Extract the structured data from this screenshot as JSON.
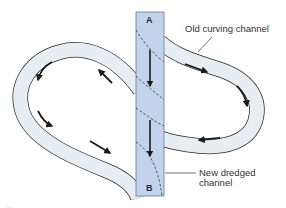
{
  "diagram": {
    "type": "river-meander-cutoff",
    "labels": {
      "old_channel": "Old curving channel",
      "new_channel_line1": "New dredged",
      "new_channel_line2": "channel",
      "point_a": "A",
      "point_b": "B"
    },
    "caption_fragment": "...",
    "colors": {
      "water": "#e6eef4",
      "new_channel": "#c3d3ec",
      "outline": "#2b2b2b",
      "arrow": "#1a1a1a",
      "background": "#ffffff"
    },
    "flow_direction": "A to B (top to bottom) in new channel; arrows in old channel follow the meander"
  }
}
